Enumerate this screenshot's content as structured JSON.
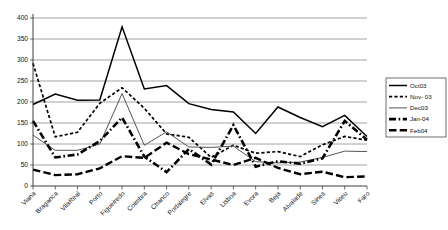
{
  "chart_data": {
    "type": "line",
    "title": "",
    "subtitle": "",
    "xlabel": "",
    "ylabel": "",
    "ylim": [
      0,
      400
    ],
    "ytick_step": 50,
    "yticks": [
      0,
      50,
      100,
      150,
      200,
      250,
      300,
      350,
      400
    ],
    "grid": true,
    "grid_axis": "y",
    "legend_position": "right",
    "categories": [
      "Viana",
      "Braganca",
      "VilaReal",
      "Porto",
      "Figueiredo",
      "Coimbra",
      "Chanco",
      "Portalegre",
      "Elvas",
      "Lisboa",
      "Evora",
      "Beja",
      "Alvalade",
      "Sines",
      "Viseu",
      "Faro"
    ],
    "series": [
      {
        "name": "Oct03",
        "style": "thin-solid",
        "color": "#000000",
        "values": [
          194,
          219,
          204,
          205,
          379,
          231,
          239,
          196,
          182,
          176,
          125,
          188,
          163,
          141,
          168,
          118
        ]
      },
      {
        "name": "Nov- 03",
        "style": "dotted",
        "color": "#000000",
        "values": [
          292,
          117,
          128,
          197,
          234,
          185,
          124,
          116,
          68,
          97,
          78,
          82,
          70,
          98,
          118,
          109
        ]
      },
      {
        "name": "Dec03",
        "style": "thin-solid-gray",
        "color": "#555555",
        "values": [
          121,
          85,
          85,
          100,
          220,
          97,
          129,
          93,
          92,
          95,
          58,
          55,
          57,
          68,
          83,
          82
        ]
      },
      {
        "name": "Jan-04",
        "style": "thick-dashdot",
        "color": "#000000",
        "values": [
          155,
          68,
          75,
          107,
          163,
          70,
          33,
          88,
          51,
          145,
          46,
          59,
          53,
          66,
          155,
          110
        ]
      },
      {
        "name": "Feb04",
        "style": "thick-dash",
        "color": "#000000",
        "values": [
          39,
          26,
          28,
          42,
          71,
          67,
          103,
          76,
          63,
          50,
          67,
          43,
          28,
          34,
          21,
          23
        ]
      }
    ]
  },
  "legend": {
    "entries": [
      {
        "label": "Oct03"
      },
      {
        "label": "Nov- 03"
      },
      {
        "label": "Dec03"
      },
      {
        "label": "Jan-04"
      },
      {
        "label": "Feb04"
      }
    ]
  }
}
